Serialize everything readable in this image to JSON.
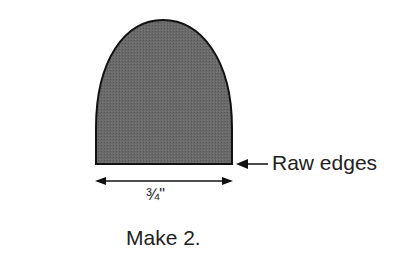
{
  "diagram": {
    "shape": "parabolic arch template piece (shaded)",
    "fill_color": "#6b6b6b",
    "outline_color": "#111111",
    "labels": {
      "raw_edges": "Raw edges",
      "width_dimension": "¾\"",
      "instruction": "Make 2."
    },
    "icons": {
      "raw_edge_pointer": "left-arrow",
      "width_dimension_arrow": "double-headed-arrow"
    }
  }
}
